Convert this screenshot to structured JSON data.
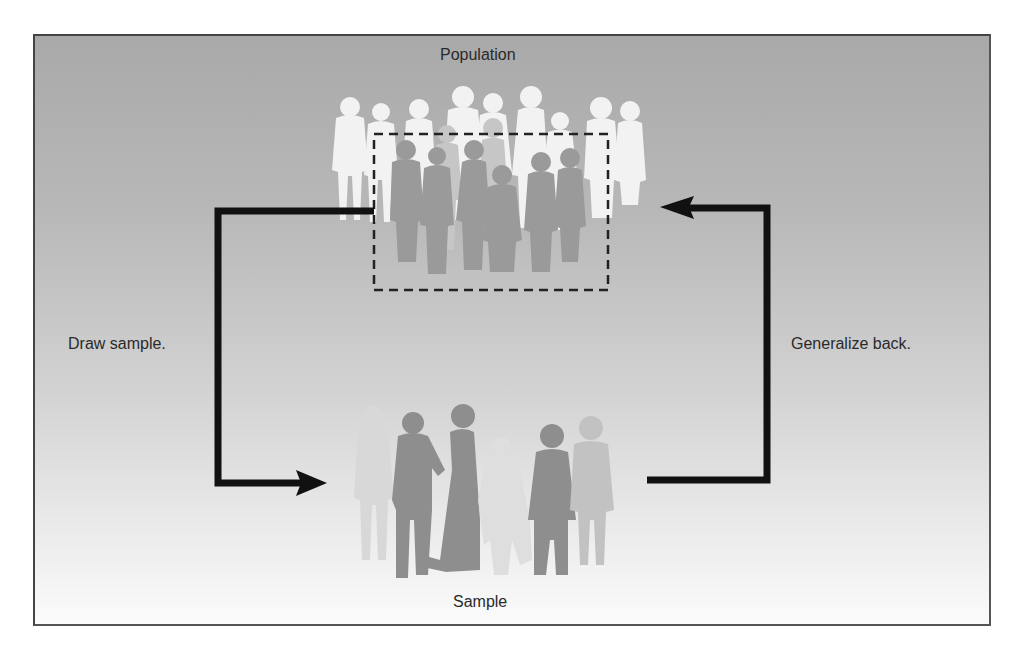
{
  "diagram": {
    "nodes": {
      "population": {
        "label": "Population"
      },
      "sample": {
        "label": "Sample"
      }
    },
    "edges": [
      {
        "from": "population",
        "to": "sample",
        "label": "Draw sample."
      },
      {
        "from": "sample",
        "to": "population",
        "label": "Generalize back."
      }
    ],
    "selection_box": {
      "style": "dashed",
      "description": "subset of population selected as sample"
    }
  },
  "colors": {
    "arrow": "#111111",
    "text": "#2a2a2a",
    "frame_border": "#444444",
    "background_top": "#a9a9a9",
    "background_bottom": "#fbfbfb",
    "figure_light": "#f4f4f4",
    "figure_mid": "#bdbdbd",
    "figure_dark": "#8a8a8a"
  }
}
